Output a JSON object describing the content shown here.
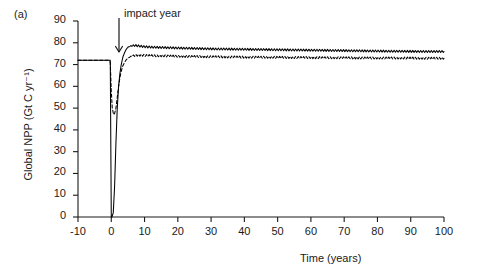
{
  "panel": {
    "label": "(a)"
  },
  "annotation": {
    "text": "impact year",
    "icon": "down-arrow-icon",
    "x_value": 0
  },
  "chart_data": {
    "type": "line",
    "title": "",
    "xlabel": "Time (years)",
    "ylabel": "Global NPP (Gt C yr⁻¹)",
    "xlim": [
      -10,
      100
    ],
    "ylim": [
      0,
      90
    ],
    "xticks": [
      -10,
      0,
      10,
      20,
      30,
      40,
      50,
      60,
      70,
      80,
      90,
      100
    ],
    "yticks": [
      0,
      10,
      20,
      30,
      40,
      50,
      60,
      70,
      80,
      90
    ],
    "grid": false,
    "legend": "none",
    "frame": "open-left-bottom",
    "line_color": "#000000",
    "background": "#ffffff",
    "annotations": [
      {
        "text": "impact year",
        "x": 0,
        "type": "arrow-down"
      }
    ],
    "series": [
      {
        "name": "solid",
        "style": "solid",
        "color": "#000000",
        "description": "Global NPP collapses to zero at impact year then recovers above pre-impact baseline",
        "x": [
          -10,
          -5,
          -1,
          -0.3,
          0,
          0.2,
          0.6,
          1,
          1.4,
          1.8,
          2.2,
          2.6,
          3,
          3.5,
          4,
          4.5,
          5,
          6,
          7,
          8,
          9,
          10,
          12,
          14,
          16,
          18,
          20,
          25,
          30,
          35,
          40,
          45,
          50,
          55,
          60,
          65,
          70,
          75,
          80,
          85,
          90,
          95,
          100
        ],
        "y": [
          72,
          72,
          72,
          72,
          0,
          0,
          2,
          14,
          34,
          50,
          60,
          66,
          70,
          73.5,
          75.5,
          77,
          78,
          78.6,
          78.8,
          78.6,
          78.4,
          78.2,
          78,
          77.9,
          77.8,
          77.7,
          77.6,
          77.4,
          77.2,
          77.1,
          77,
          76.9,
          76.8,
          76.7,
          76.6,
          76.5,
          76.4,
          76.3,
          76.2,
          76.1,
          76.05,
          76,
          76
        ]
      },
      {
        "name": "dashed",
        "style": "dashed",
        "color": "#000000",
        "description": "Partial decline to about 47 at impact year then recovery to slightly above baseline",
        "x": [
          -10,
          -5,
          -1,
          -0.3,
          0,
          0.3,
          0.7,
          1,
          1.4,
          1.8,
          2.2,
          2.6,
          3,
          3.5,
          4,
          4.5,
          5,
          6,
          7,
          8,
          9,
          10,
          12,
          14,
          16,
          18,
          20,
          25,
          30,
          35,
          40,
          45,
          50,
          55,
          60,
          65,
          70,
          75,
          80,
          85,
          90,
          95,
          100
        ],
        "y": [
          72,
          72,
          72,
          71,
          58,
          50,
          47,
          47.5,
          50,
          55,
          60,
          64,
          67,
          69.5,
          71,
          72.2,
          73,
          73.8,
          74.2,
          74.3,
          74.3,
          74.2,
          74.1,
          74,
          74,
          73.9,
          73.8,
          73.7,
          73.6,
          73.5,
          73.4,
          73.35,
          73.3,
          73.25,
          73.2,
          73.15,
          73.1,
          73.05,
          73,
          73,
          72.95,
          72.9,
          72.9
        ]
      }
    ],
    "oscillation": {
      "description": "Seasonal sawtooth ripple superimposed on both series after recovery",
      "period_years": 0.8,
      "amplitude": 0.45,
      "start_year": 5
    },
    "baseline_value": 72,
    "solid_minimum": 0,
    "dashed_minimum": 47,
    "solid_peak": 78.8,
    "dashed_peak": 74.3
  }
}
